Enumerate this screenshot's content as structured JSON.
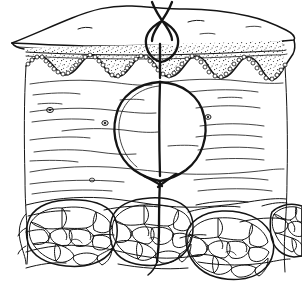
{
  "figure": {
    "title": "Cross-section of skin with buried dermal suture",
    "type": "anatomical-line-drawing",
    "style": "black ink line art on white",
    "dimensions": {
      "width": 302,
      "height": 288
    },
    "colors": {
      "background": "#ffffff",
      "ink": "#141414",
      "stipple": "#1a1a1a"
    }
  },
  "layers": [
    {
      "id": "surface",
      "label": "Skin surface (perspective top face)",
      "description": "Slanted three-dimensional top plane of the skin block with irregular wavy outer margin and two short surface creases"
    },
    {
      "id": "epidermis",
      "label": "Epidermis",
      "description": "Densely stippled band below the surface with a fine horizontal stratum corneum line at its top and a wavy scalloped lower margin",
      "basal_layer": "Row of small circular basal keratinocytes tracing the rete ridges",
      "rete_ridge_count": 6
    },
    {
      "id": "dermis",
      "label": "Dermis",
      "description": "Large pale zone crossed by thin wavy horizontal collagen fibre bundles, containing small dark oval vessel profiles",
      "vessel_count": 4
    },
    {
      "id": "subcutis",
      "label": "Subcutaneous fat",
      "description": "Four lobules of adipose tissue built from irregular polygonal fat cells, separated by fibrous septa"
    }
  ],
  "suture": {
    "label": "Buried dermal suture",
    "parts": [
      {
        "id": "free-ends",
        "label": "Free suture ends crossing above the skin"
      },
      {
        "id": "surface-knot-loop",
        "label": "Small knot loop at the skin surface"
      },
      {
        "id": "dermal-loop",
        "label": "Large oval suture loop within the dermis"
      },
      {
        "id": "needle-pass",
        "label": "Vertical thread passing through the dermis"
      },
      {
        "id": "deep-crossing",
        "label": "Thread crossing at the base of the dermal loop"
      },
      {
        "id": "deep-tail",
        "label": "Thread tail descending into the fat lobule"
      }
    ]
  },
  "fat_lobules": [
    {
      "id": "lobule-left",
      "label": "Left fat lobule",
      "cx": 68,
      "cy": 232,
      "rx": 48,
      "ry": 30
    },
    {
      "id": "lobule-center",
      "label": "Central fat lobule",
      "cx": 150,
      "cy": 233,
      "rx": 40,
      "ry": 31
    },
    {
      "id": "lobule-right",
      "label": "Right fat lobule",
      "cx": 228,
      "cy": 244,
      "rx": 44,
      "ry": 32
    },
    {
      "id": "lobule-edge",
      "label": "Right edge fat lobule",
      "cx": 292,
      "cy": 231,
      "rx": 22,
      "ry": 26
    }
  ],
  "dermal_vessels": [
    {
      "id": "vessel-1",
      "cx": 50,
      "cy": 110
    },
    {
      "id": "vessel-2",
      "cx": 105,
      "cy": 123
    },
    {
      "id": "vessel-3",
      "cx": 208,
      "cy": 117
    },
    {
      "id": "vessel-4",
      "cx": 92,
      "cy": 180
    }
  ]
}
